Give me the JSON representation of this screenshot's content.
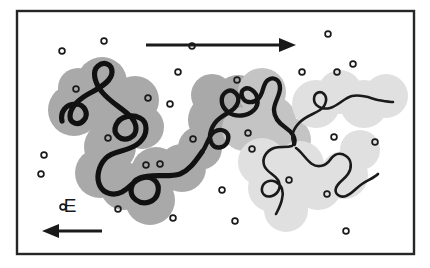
{
  "figure": {
    "caption": "",
    "background_color": "#ffffff"
  },
  "frame": {
    "name": "diagram-border",
    "x": 17,
    "y": 11,
    "width": 397,
    "height": 243,
    "stroke_color": "#262626",
    "stroke_width": 2.4,
    "fill_color": "#ffffff"
  },
  "labels": {
    "field_label": "E",
    "field_label_x": 70,
    "field_label_y": 212
  },
  "arrows": {
    "migration_arrow": {
      "name": "migration-direction-arrow",
      "direction": "right",
      "x1": 146,
      "y1": 45,
      "x2": 296,
      "y2": 45,
      "stroke_color": "#1a1a1a",
      "stroke_width": 3.2,
      "head_length": 17,
      "head_half_width": 7
    },
    "field_arrow": {
      "name": "electric-field-arrow",
      "direction": "left",
      "x1": 102,
      "y1": 231,
      "x2": 42,
      "y2": 231,
      "stroke_color": "#1a1a1a",
      "stroke_width": 3.2,
      "head_length": 17,
      "head_half_width": 7
    }
  },
  "colors": {
    "blob_dark": "#a9a9a9",
    "blob_mid": "#c4c4c4",
    "blob_light": "#e0e0e0",
    "chain_dark": "#111111",
    "chain_light": "#1a1a1a",
    "ion_stroke": "#1a1a1a",
    "frame": "#262626"
  },
  "chart_data": {
    "type": "diagram",
    "xlabel": "",
    "ylabel": "",
    "grid": false,
    "legend": false,
    "annotations": [
      {
        "text": "E",
        "x": 70,
        "y": 212,
        "meaning": "electric field direction label"
      }
    ],
    "blobs": [
      {
        "cx": 74,
        "cy": 110,
        "r": 26,
        "shade": "dark"
      },
      {
        "cx": 78,
        "cy": 88,
        "r": 20,
        "shade": "dark"
      },
      {
        "cx": 102,
        "cy": 82,
        "r": 25,
        "shade": "dark"
      },
      {
        "cx": 112,
        "cy": 113,
        "r": 25,
        "shade": "dark"
      },
      {
        "cx": 135,
        "cy": 100,
        "r": 24,
        "shade": "dark"
      },
      {
        "cx": 142,
        "cy": 127,
        "r": 22,
        "shade": "dark"
      },
      {
        "cx": 110,
        "cy": 147,
        "r": 26,
        "shade": "dark"
      },
      {
        "cx": 100,
        "cy": 173,
        "r": 25,
        "shade": "dark"
      },
      {
        "cx": 124,
        "cy": 186,
        "r": 24,
        "shade": "dark"
      },
      {
        "cx": 150,
        "cy": 200,
        "r": 25,
        "shade": "dark"
      },
      {
        "cx": 156,
        "cy": 172,
        "r": 25,
        "shade": "dark"
      },
      {
        "cx": 182,
        "cy": 168,
        "r": 24,
        "shade": "dark"
      },
      {
        "cx": 200,
        "cy": 148,
        "r": 22,
        "shade": "dark"
      },
      {
        "cx": 214,
        "cy": 120,
        "r": 26,
        "shade": "dark"
      },
      {
        "cx": 212,
        "cy": 95,
        "r": 21,
        "shade": "dark"
      },
      {
        "cx": 238,
        "cy": 100,
        "r": 25,
        "shade": "dark"
      },
      {
        "cx": 244,
        "cy": 129,
        "r": 22,
        "shade": "mid"
      },
      {
        "cx": 262,
        "cy": 92,
        "r": 24,
        "shade": "mid"
      },
      {
        "cx": 272,
        "cy": 120,
        "r": 24,
        "shade": "mid"
      },
      {
        "cx": 288,
        "cy": 140,
        "r": 23,
        "shade": "mid"
      },
      {
        "cx": 262,
        "cy": 162,
        "r": 24,
        "shade": "light"
      },
      {
        "cx": 272,
        "cy": 188,
        "r": 24,
        "shade": "light"
      },
      {
        "cx": 286,
        "cy": 210,
        "r": 22,
        "shade": "light"
      },
      {
        "cx": 300,
        "cy": 165,
        "r": 24,
        "shade": "light"
      },
      {
        "cx": 318,
        "cy": 186,
        "r": 24,
        "shade": "light"
      },
      {
        "cx": 344,
        "cy": 175,
        "r": 24,
        "shade": "light"
      },
      {
        "cx": 316,
        "cy": 104,
        "r": 24,
        "shade": "light"
      },
      {
        "cx": 340,
        "cy": 92,
        "r": 22,
        "shade": "light"
      },
      {
        "cx": 364,
        "cy": 104,
        "r": 24,
        "shade": "light"
      },
      {
        "cx": 386,
        "cy": 96,
        "r": 22,
        "shade": "light"
      },
      {
        "cx": 360,
        "cy": 150,
        "r": 20,
        "shade": "light"
      }
    ],
    "ions": [
      {
        "cx": 104,
        "cy": 41
      },
      {
        "cx": 62,
        "cy": 51
      },
      {
        "cx": 178,
        "cy": 72
      },
      {
        "cx": 76,
        "cy": 89
      },
      {
        "cx": 148,
        "cy": 98
      },
      {
        "cx": 170,
        "cy": 104
      },
      {
        "cx": 328,
        "cy": 34
      },
      {
        "cx": 353,
        "cy": 64
      },
      {
        "cx": 337,
        "cy": 72
      },
      {
        "cx": 237,
        "cy": 80
      },
      {
        "cx": 193,
        "cy": 139
      },
      {
        "cx": 248,
        "cy": 133
      },
      {
        "cx": 44,
        "cy": 155
      },
      {
        "cx": 41,
        "cy": 174
      },
      {
        "cx": 108,
        "cy": 138
      },
      {
        "cx": 146,
        "cy": 165
      },
      {
        "cx": 160,
        "cy": 164
      },
      {
        "cx": 252,
        "cy": 149
      },
      {
        "cx": 375,
        "cy": 142
      },
      {
        "cx": 334,
        "cy": 137
      },
      {
        "cx": 289,
        "cy": 180
      },
      {
        "cx": 222,
        "cy": 190
      },
      {
        "cx": 118,
        "cy": 209
      },
      {
        "cx": 173,
        "cy": 218
      },
      {
        "cx": 235,
        "cy": 221
      },
      {
        "cx": 327,
        "cy": 194
      },
      {
        "cx": 346,
        "cy": 231
      },
      {
        "cx": 63,
        "cy": 207
      },
      {
        "cx": 302,
        "cy": 72
      },
      {
        "cx": 192,
        "cy": 46
      }
    ]
  }
}
